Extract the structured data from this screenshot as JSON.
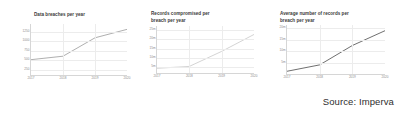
{
  "source_note": "Source: Imperva",
  "chart_data": [
    {
      "type": "line",
      "title": "Data breaches per year",
      "xlabel": "",
      "ylabel": "",
      "x": [
        "2017",
        "2018",
        "2019",
        "2020"
      ],
      "categories": [
        "2017",
        "2018",
        "2019",
        "2020"
      ],
      "values": [
        520,
        610,
        1090,
        1310
      ],
      "yticks": [
        250,
        500,
        750,
        1000,
        1250
      ],
      "ytick_labels": [
        "250",
        "500",
        "750",
        "1000",
        "1250"
      ],
      "xtick_labels": [
        "2017",
        "2018",
        "2019",
        "2020"
      ],
      "ylim": [
        120,
        1450
      ],
      "grid": true,
      "legend": false,
      "line_color": "#9a9a9a"
    },
    {
      "type": "line",
      "title": "Records compromised per\nbreach per year",
      "xlabel": "",
      "ylabel": "",
      "x": [
        "2017",
        "2018",
        "2019",
        "2020"
      ],
      "categories": [
        "2017",
        "2018",
        "2019",
        "2020"
      ],
      "values": [
        4.5,
        5.5,
        13.5,
        22.5
      ],
      "yticks": [
        5,
        10,
        15,
        20,
        25
      ],
      "ytick_labels": [
        "5m",
        "10m",
        "15m",
        "20m",
        "25m"
      ],
      "xtick_labels": [
        "2017",
        "2018",
        "2019",
        "2020"
      ],
      "ylim": [
        2,
        27
      ],
      "grid": true,
      "legend": false,
      "line_color": "#c9c9c9"
    },
    {
      "type": "line",
      "title": "Average number of records per\nbreach per year",
      "xlabel": "",
      "ylabel": "",
      "x": [
        "2017",
        "2018",
        "2019",
        "2020"
      ],
      "categories": [
        "2017",
        "2018",
        "2019",
        "2020"
      ],
      "values": [
        1.2,
        4.0,
        12.5,
        19.0
      ],
      "yticks": [
        5,
        10,
        15,
        20
      ],
      "ytick_labels": [
        "5m",
        "10m",
        "15m",
        "20m"
      ],
      "xtick_labels": [
        "2017",
        "2018",
        "2019",
        "2020"
      ],
      "ylim": [
        0,
        21.5
      ],
      "grid": true,
      "legend": false,
      "line_color": "#4a4a4a"
    }
  ]
}
